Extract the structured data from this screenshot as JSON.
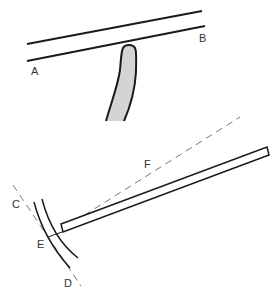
{
  "diagram": {
    "labels": {
      "A": "A",
      "B": "B",
      "C": "C",
      "D": "D",
      "E": "E",
      "F": "F"
    },
    "colors": {
      "stroke": "#1a1a1a",
      "fill_shape": "#d4d4d4",
      "dashed": "#777777",
      "background": "#ffffff"
    }
  }
}
